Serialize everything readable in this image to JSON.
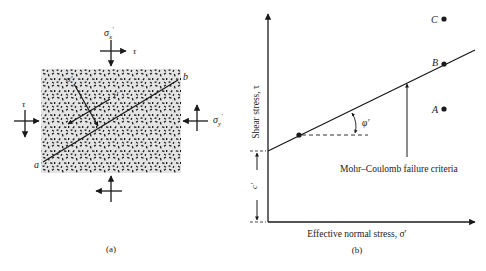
{
  "panel_a": {
    "caption": "(a)",
    "top_normal_label": "σ′x",
    "top_normal_base": "σ",
    "top_normal_sub": "x",
    "top_shear_label": "τ",
    "left_shear_label": "τ",
    "right_normal_label": "σ′y",
    "right_normal_base": "σ",
    "right_normal_sub": "y",
    "plane_normal_label": "σ′",
    "plane_shear_label": "τ′",
    "plane_start_label": "a",
    "plane_end_label": "b",
    "soil_fill_color": "#e4e4e4",
    "grain_color": "#1a1a1a"
  },
  "panel_b": {
    "caption": "(b)",
    "y_axis_label": "Shear stress, τ",
    "x_axis_label": "Effective normal stress, σ′",
    "cohesion_label": "c′",
    "friction_angle_label": "φ′",
    "envelope_label": "Mohr–Coulomb failure criteria",
    "points": [
      {
        "id": "C",
        "label": "C",
        "position": "above envelope"
      },
      {
        "id": "B",
        "label": "B",
        "position": "on envelope"
      },
      {
        "id": "A",
        "label": "A",
        "position": "below envelope"
      }
    ],
    "line_color": "#1a1a1a"
  }
}
